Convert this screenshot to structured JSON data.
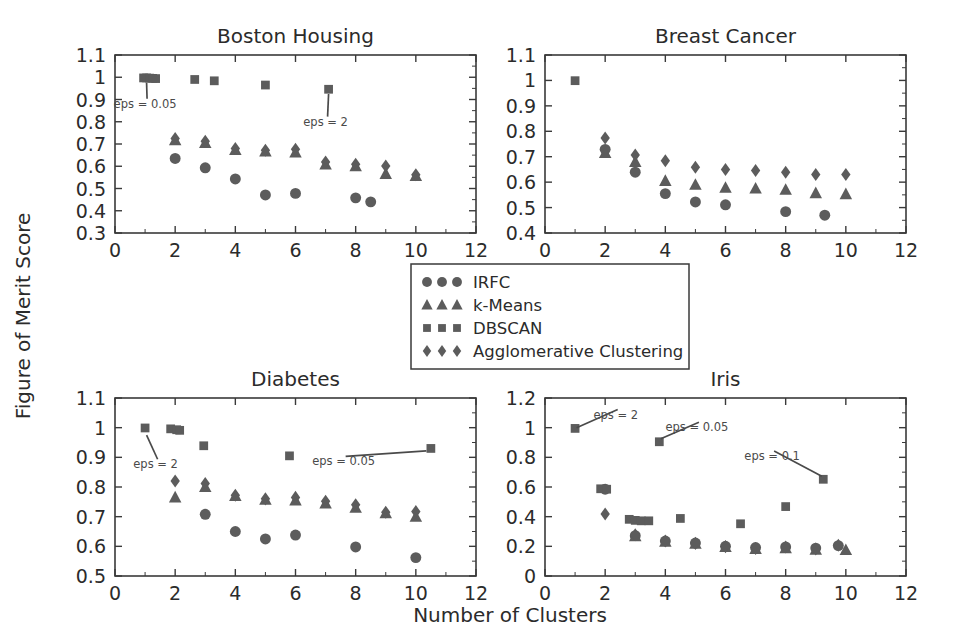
{
  "figure": {
    "ylabel": "Figure of Merit Score",
    "xlabel": "Number of Clusters"
  },
  "legend": {
    "items": [
      {
        "label": "IRFC",
        "marker": "circle"
      },
      {
        "label": "k-Means",
        "marker": "triangle"
      },
      {
        "label": "DBSCAN",
        "marker": "square"
      },
      {
        "label": "Agglomerative Clustering",
        "marker": "diamond"
      }
    ]
  },
  "chart_data": [
    {
      "type": "scatter",
      "title": "Boston Housing",
      "xlabel": "Number of Clusters",
      "ylabel": "Figure of Merit Score",
      "xlim": [
        0,
        12
      ],
      "ylim": [
        0.3,
        1.1
      ],
      "xticks": [
        0,
        2,
        4,
        6,
        8,
        10,
        12
      ],
      "yticks": [
        0.3,
        0.4,
        0.5,
        0.6,
        0.7,
        0.8,
        0.9,
        1.0,
        1.1
      ],
      "grid": false,
      "series": [
        {
          "name": "IRFC",
          "marker": "circle",
          "points": [
            [
              2,
              0.635
            ],
            [
              3,
              0.593
            ],
            [
              4,
              0.543
            ],
            [
              5,
              0.471
            ],
            [
              6,
              0.478
            ],
            [
              8,
              0.458
            ],
            [
              8.5,
              0.44
            ]
          ]
        },
        {
          "name": "k-Means",
          "marker": "triangle",
          "points": [
            [
              2,
              0.717
            ],
            [
              3,
              0.705
            ],
            [
              4,
              0.673
            ],
            [
              5,
              0.667
            ],
            [
              6,
              0.662
            ],
            [
              7,
              0.608
            ],
            [
              8,
              0.6
            ],
            [
              9,
              0.566
            ],
            [
              10,
              0.556
            ]
          ]
        },
        {
          "name": "DBSCAN",
          "marker": "square",
          "points": [
            [
              0.95,
              0.997
            ],
            [
              1.05,
              0.997
            ],
            [
              1.15,
              0.996
            ],
            [
              1.25,
              0.995
            ],
            [
              1.35,
              0.994
            ],
            [
              2.65,
              0.99
            ],
            [
              3.3,
              0.984
            ],
            [
              5,
              0.965
            ],
            [
              7.1,
              0.946
            ]
          ]
        },
        {
          "name": "Agglomerative Clustering",
          "marker": "diamond",
          "points": [
            [
              2,
              0.725
            ],
            [
              3,
              0.712
            ],
            [
              4,
              0.68
            ],
            [
              5,
              0.672
            ],
            [
              6,
              0.676
            ],
            [
              7,
              0.619
            ],
            [
              8,
              0.609
            ],
            [
              9,
              0.601
            ],
            [
              10,
              0.562
            ]
          ]
        }
      ],
      "annotations": [
        {
          "text": "eps = 0.05",
          "x": 1.0,
          "y": 0.885,
          "point_x": 1.05,
          "point_y": 0.975
        },
        {
          "text": "eps = 2",
          "x": 7.0,
          "y": 0.805,
          "point_x": 7.1,
          "point_y": 0.925
        }
      ]
    },
    {
      "type": "scatter",
      "title": "Breast Cancer",
      "xlabel": "Number of Clusters",
      "ylabel": "Figure of Merit Score",
      "xlim": [
        0,
        12
      ],
      "ylim": [
        0.4,
        1.1
      ],
      "xticks": [
        0,
        2,
        4,
        6,
        8,
        10,
        12
      ],
      "yticks": [
        0.4,
        0.5,
        0.6,
        0.7,
        0.8,
        0.9,
        1.0,
        1.1
      ],
      "grid": false,
      "series": [
        {
          "name": "IRFC",
          "marker": "circle",
          "points": [
            [
              2,
              0.729
            ],
            [
              3,
              0.639
            ],
            [
              4,
              0.555
            ],
            [
              5,
              0.522
            ],
            [
              6,
              0.511
            ],
            [
              8,
              0.484
            ],
            [
              9.3,
              0.47
            ]
          ]
        },
        {
          "name": "k-Means",
          "marker": "triangle",
          "points": [
            [
              2,
              0.715
            ],
            [
              3,
              0.68
            ],
            [
              4,
              0.605
            ],
            [
              5,
              0.59
            ],
            [
              6,
              0.578
            ],
            [
              7,
              0.575
            ],
            [
              8,
              0.57
            ],
            [
              9,
              0.557
            ],
            [
              10,
              0.553
            ]
          ]
        },
        {
          "name": "DBSCAN",
          "marker": "square",
          "points": [
            [
              1,
              0.999
            ]
          ]
        },
        {
          "name": "Agglomerative Clustering",
          "marker": "diamond",
          "points": [
            [
              2,
              0.774
            ],
            [
              3,
              0.707
            ],
            [
              4,
              0.684
            ],
            [
              5,
              0.659
            ],
            [
              6,
              0.65
            ],
            [
              7,
              0.646
            ],
            [
              8,
              0.639
            ],
            [
              9,
              0.63
            ],
            [
              10,
              0.63
            ]
          ]
        }
      ],
      "annotations": []
    },
    {
      "type": "scatter",
      "title": "Diabetes",
      "xlabel": "Number of Clusters",
      "ylabel": "Figure of Merit Score",
      "xlim": [
        0,
        12
      ],
      "ylim": [
        0.5,
        1.1
      ],
      "xticks": [
        0,
        2,
        4,
        6,
        8,
        10,
        12
      ],
      "yticks": [
        0.5,
        0.6,
        0.7,
        0.8,
        0.9,
        1.0,
        1.1
      ],
      "grid": false,
      "series": [
        {
          "name": "IRFC",
          "marker": "circle",
          "points": [
            [
              3,
              0.708
            ],
            [
              4,
              0.65
            ],
            [
              5,
              0.625
            ],
            [
              6,
              0.638
            ],
            [
              8,
              0.598
            ],
            [
              10,
              0.562
            ]
          ]
        },
        {
          "name": "k-Means",
          "marker": "triangle",
          "points": [
            [
              2,
              0.765
            ],
            [
              3,
              0.8
            ],
            [
              4,
              0.77
            ],
            [
              5,
              0.757
            ],
            [
              6,
              0.755
            ],
            [
              7,
              0.745
            ],
            [
              8,
              0.73
            ],
            [
              9,
              0.712
            ],
            [
              10,
              0.7
            ]
          ]
        },
        {
          "name": "DBSCAN",
          "marker": "square",
          "points": [
            [
              1,
              0.999
            ],
            [
              1.85,
              0.996
            ],
            [
              2.05,
              0.993
            ],
            [
              2.15,
              0.991
            ],
            [
              2.95,
              0.939
            ],
            [
              5.8,
              0.905
            ],
            [
              10.5,
              0.93
            ]
          ]
        },
        {
          "name": "Agglomerative Clustering",
          "marker": "diamond",
          "points": [
            [
              2,
              0.82
            ],
            [
              3,
              0.812
            ],
            [
              4,
              0.772
            ],
            [
              5,
              0.76
            ],
            [
              6,
              0.765
            ],
            [
              7,
              0.752
            ],
            [
              8,
              0.74
            ],
            [
              9,
              0.715
            ],
            [
              10,
              0.717
            ]
          ]
        }
      ],
      "annotations": [
        {
          "text": "eps = 2",
          "x": 1.35,
          "y": 0.88,
          "point_x": 1.05,
          "point_y": 0.975
        },
        {
          "text": "eps = 0.05",
          "x": 7.6,
          "y": 0.89,
          "point_x": 10.35,
          "point_y": 0.922
        }
      ]
    },
    {
      "type": "scatter",
      "title": "Iris",
      "xlabel": "Number of Clusters",
      "ylabel": "Figure of Merit Score",
      "xlim": [
        0,
        12
      ],
      "ylim": [
        0.0,
        1.2
      ],
      "xticks": [
        0,
        2,
        4,
        6,
        8,
        10,
        12
      ],
      "yticks": [
        0.0,
        0.2,
        0.4,
        0.6,
        0.8,
        1.0,
        1.2
      ],
      "grid": false,
      "series": [
        {
          "name": "IRFC",
          "marker": "circle",
          "points": [
            [
              2,
              0.585
            ],
            [
              3,
              0.272
            ],
            [
              4,
              0.236
            ],
            [
              5,
              0.222
            ],
            [
              6,
              0.2
            ],
            [
              7,
              0.192
            ],
            [
              8,
              0.196
            ],
            [
              9,
              0.188
            ],
            [
              9.75,
              0.205
            ]
          ]
        },
        {
          "name": "k-Means",
          "marker": "triangle",
          "points": [
            [
              3,
              0.268
            ],
            [
              4,
              0.232
            ],
            [
              5,
              0.218
            ],
            [
              6,
              0.196
            ],
            [
              7,
              0.182
            ],
            [
              8,
              0.188
            ],
            [
              9,
              0.178
            ],
            [
              10,
              0.176
            ]
          ]
        },
        {
          "name": "DBSCAN",
          "marker": "square",
          "points": [
            [
              1,
              0.995
            ],
            [
              1.85,
              0.588
            ],
            [
              2.05,
              0.585
            ],
            [
              2.8,
              0.382
            ],
            [
              3.0,
              0.375
            ],
            [
              3.2,
              0.372
            ],
            [
              3.45,
              0.372
            ],
            [
              3.8,
              0.905
            ],
            [
              4.5,
              0.388
            ],
            [
              6.5,
              0.352
            ],
            [
              8,
              0.468
            ],
            [
              9.25,
              0.652
            ]
          ]
        },
        {
          "name": "Agglomerative Clustering",
          "marker": "diamond",
          "points": [
            [
              2,
              0.418
            ],
            [
              3,
              0.278
            ],
            [
              4,
              0.236
            ],
            [
              5,
              0.22
            ],
            [
              6,
              0.198
            ],
            [
              7,
              0.185
            ],
            [
              8,
              0.196
            ],
            [
              9,
              0.182
            ],
            [
              9.75,
              0.208
            ]
          ]
        }
      ],
      "annotations": [
        {
          "text": "eps = 2",
          "x": 2.35,
          "y": 1.095,
          "point_x": 1.05,
          "point_y": 1.0
        },
        {
          "text": "eps = 0.05",
          "x": 5.05,
          "y": 1.01,
          "point_x": 3.85,
          "point_y": 0.925
        },
        {
          "text": "eps = 0.1",
          "x": 7.55,
          "y": 0.815,
          "point_x": 9.2,
          "point_y": 0.672
        }
      ]
    }
  ]
}
